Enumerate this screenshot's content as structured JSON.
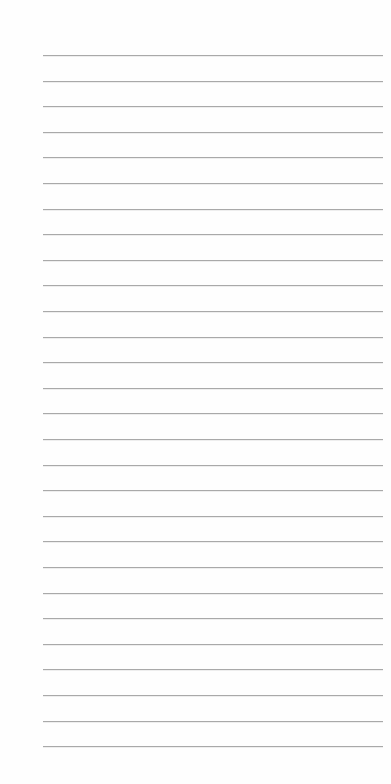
{
  "page": {
    "type": "lined-paper",
    "background_color": "#fefefe",
    "line_color": "#a9a9a9",
    "line_count": 28,
    "first_line_y": 55,
    "line_spacing": 25.6,
    "line_left": 43,
    "line_width": 340,
    "text": ""
  }
}
